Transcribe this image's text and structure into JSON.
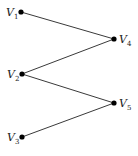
{
  "diagram": {
    "type": "bipartite-graph",
    "nodes": [
      {
        "id": "V1",
        "base": "V",
        "sub": "1",
        "x": 21,
        "y": 12,
        "label_side": "left"
      },
      {
        "id": "V2",
        "base": "V",
        "sub": "2",
        "x": 22,
        "y": 74,
        "label_side": "left"
      },
      {
        "id": "V3",
        "base": "V",
        "sub": "3",
        "x": 22,
        "y": 137,
        "label_side": "left"
      },
      {
        "id": "V4",
        "base": "V",
        "sub": "4",
        "x": 114,
        "y": 39,
        "label_side": "right"
      },
      {
        "id": "V5",
        "base": "V",
        "sub": "5",
        "x": 114,
        "y": 103,
        "label_side": "right"
      }
    ],
    "edges": [
      {
        "from": "V1",
        "to": "V4"
      },
      {
        "from": "V2",
        "to": "V4"
      },
      {
        "from": "V2",
        "to": "V5"
      },
      {
        "from": "V3",
        "to": "V5"
      }
    ],
    "colors": {
      "node": "#000000",
      "edge": "#3a3a3a",
      "background": "#ffffff"
    }
  }
}
